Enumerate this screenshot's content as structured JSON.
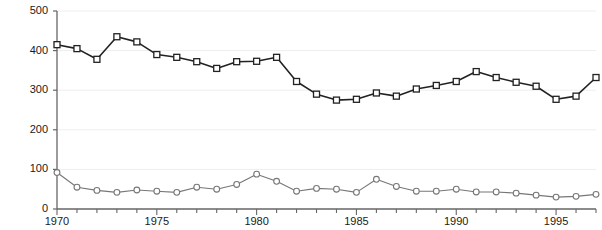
{
  "chart_data": {
    "type": "line",
    "title": "",
    "subtitle": "",
    "xlabel": "",
    "ylabel": "",
    "xlim": [
      1970,
      1997
    ],
    "ylim": [
      0,
      500
    ],
    "grid": true,
    "legend": "none",
    "x": [
      1970,
      1971,
      1972,
      1973,
      1974,
      1975,
      1976,
      1977,
      1978,
      1979,
      1980,
      1981,
      1982,
      1983,
      1984,
      1985,
      1986,
      1987,
      1988,
      1989,
      1990,
      1991,
      1992,
      1993,
      1994,
      1995,
      1996,
      1997
    ],
    "xticks": [
      1970,
      1975,
      1980,
      1985,
      1990,
      1995
    ],
    "xtick_labels": [
      "1970",
      "1975",
      "1980",
      "1985",
      "1990",
      "1995"
    ],
    "yticks": [
      0,
      100,
      200,
      300,
      400,
      500
    ],
    "ytick_labels": [
      "0",
      "100",
      "200",
      "300",
      "400",
      "500"
    ],
    "series": [
      {
        "name": "upper-series",
        "marker": "square",
        "color": "#222222",
        "values": [
          415,
          405,
          378,
          435,
          422,
          390,
          383,
          372,
          355,
          372,
          373,
          383,
          322,
          290,
          275,
          277,
          293,
          285,
          303,
          312,
          322,
          347,
          332,
          320,
          310,
          277,
          285,
          332
        ]
      },
      {
        "name": "lower-series",
        "marker": "circle",
        "color": "#777777",
        "values": [
          92,
          55,
          47,
          42,
          48,
          45,
          42,
          55,
          50,
          62,
          88,
          70,
          45,
          52,
          50,
          42,
          75,
          57,
          45,
          45,
          50,
          43,
          43,
          40,
          35,
          30,
          32,
          37
        ]
      }
    ]
  }
}
